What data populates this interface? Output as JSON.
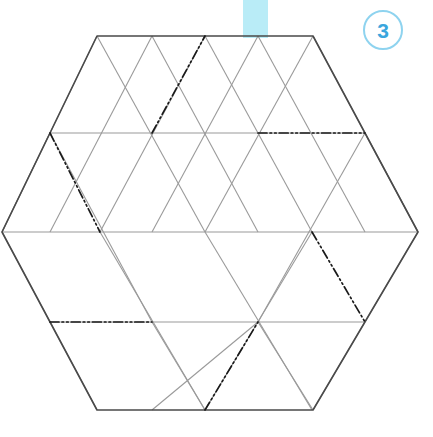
{
  "figure": {
    "step_number": "3",
    "canvas": {
      "width": 433,
      "height": 437,
      "background": "#ffffff"
    },
    "colors": {
      "outline": "#4a4a4a",
      "grid": "#9a9a9a",
      "fold": "#1a1a1a",
      "badge_ring": "#8ed3ef",
      "badge_text": "#3aa6dd",
      "guide_bar": "#b9ecf7"
    },
    "guide_bar": {
      "x": 243,
      "y": 0,
      "width": 25,
      "height": 38
    },
    "badge": {
      "x": 363,
      "y": 10,
      "diameter": 40
    },
    "hexagon_outline": [
      [
        97,
        36
      ],
      [
        313,
        36
      ],
      [
        418,
        232
      ],
      [
        313,
        410
      ],
      [
        97,
        410
      ],
      [
        2,
        232
      ]
    ],
    "grid_lines": [
      {
        "name": "horizontal-row-2",
        "x1": 50,
        "y1": 133,
        "x2": 365,
        "y2": 133
      },
      {
        "name": "horizontal-row-3",
        "x1": 2,
        "y1": 232,
        "x2": 418,
        "y2": 232
      },
      {
        "name": "horizontal-row-4",
        "x1": 50,
        "y1": 322,
        "x2": 365,
        "y2": 322
      },
      {
        "name": "diag-right-down-a",
        "x1": 97,
        "y1": 36,
        "x2": 2,
        "y2": 232
      },
      {
        "name": "diag-right-down-b",
        "x1": 152,
        "y1": 36,
        "x2": 50,
        "y2": 232
      },
      {
        "name": "diag-right-down-c",
        "x1": 205,
        "y1": 36,
        "x2": 100,
        "y2": 232
      },
      {
        "name": "diag-right-down-d",
        "x1": 258,
        "y1": 36,
        "x2": 152,
        "y2": 232
      },
      {
        "name": "diag-right-down-e",
        "x1": 313,
        "y1": 36,
        "x2": 205,
        "y2": 232
      },
      {
        "name": "diag-right-down-f",
        "x1": 365,
        "y1": 133,
        "x2": 258,
        "y2": 322
      },
      {
        "name": "diag-right-down-g",
        "x1": 418,
        "y1": 232,
        "x2": 313,
        "y2": 410
      },
      {
        "name": "diag-right-down-h",
        "x1": 50,
        "y1": 133,
        "x2": 2,
        "y2": 232
      },
      {
        "name": "diag-right-down-i",
        "x1": 312,
        "y1": 232,
        "x2": 205,
        "y2": 410
      },
      {
        "name": "diag-right-down-j",
        "x1": 258,
        "y1": 322,
        "x2": 152,
        "y2": 410
      },
      {
        "name": "diag-left-down-a",
        "x1": 313,
        "y1": 36,
        "x2": 418,
        "y2": 232
      },
      {
        "name": "diag-left-down-b",
        "x1": 258,
        "y1": 36,
        "x2": 365,
        "y2": 232
      },
      {
        "name": "diag-left-down-c",
        "x1": 205,
        "y1": 36,
        "x2": 312,
        "y2": 232
      },
      {
        "name": "diag-left-down-d",
        "x1": 152,
        "y1": 36,
        "x2": 258,
        "y2": 232
      },
      {
        "name": "diag-left-down-e",
        "x1": 97,
        "y1": 36,
        "x2": 205,
        "y2": 232
      },
      {
        "name": "diag-left-down-f",
        "x1": 50,
        "y1": 133,
        "x2": 152,
        "y2": 322
      },
      {
        "name": "diag-left-down-g",
        "x1": 2,
        "y1": 232,
        "x2": 97,
        "y2": 410
      },
      {
        "name": "diag-left-down-h",
        "x1": 100,
        "y1": 232,
        "x2": 205,
        "y2": 410
      },
      {
        "name": "diag-left-down-i",
        "x1": 152,
        "y1": 322,
        "x2": 205,
        "y2": 410
      },
      {
        "name": "diag-left-down-j",
        "x1": 205,
        "y1": 232,
        "x2": 312,
        "y2": 410
      },
      {
        "name": "diag-left-down-k",
        "x1": 365,
        "y1": 133,
        "x2": 418,
        "y2": 232
      },
      {
        "name": "diag-left-down-l",
        "x1": 258,
        "y1": 322,
        "x2": 313,
        "y2": 410
      }
    ],
    "fold_lines": [
      {
        "name": "fold-top-center-diagonal",
        "x1": 152,
        "y1": 133,
        "x2": 205,
        "y2": 36
      },
      {
        "name": "fold-top-right-horizontal",
        "x1": 258,
        "y1": 133,
        "x2": 365,
        "y2": 133
      },
      {
        "name": "fold-upper-left-diagonal",
        "x1": 50,
        "y1": 133,
        "x2": 100,
        "y2": 232
      },
      {
        "name": "fold-lower-right-diagonal",
        "x1": 312,
        "y1": 232,
        "x2": 365,
        "y2": 322
      },
      {
        "name": "fold-bottom-left-horizontal",
        "x1": 50,
        "y1": 322,
        "x2": 152,
        "y2": 322
      },
      {
        "name": "fold-bottom-center-diagonal",
        "x1": 205,
        "y1": 410,
        "x2": 258,
        "y2": 322
      }
    ]
  }
}
